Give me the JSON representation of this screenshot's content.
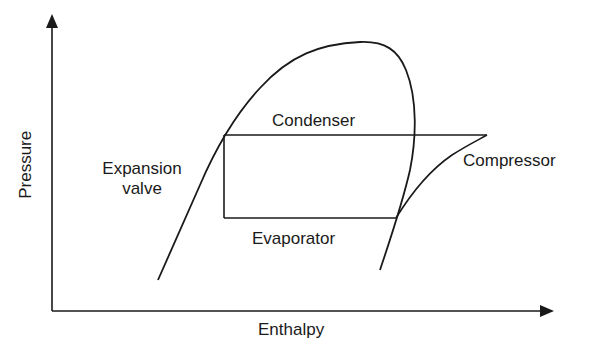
{
  "diagram": {
    "type": "pressure-enthalpy refrigeration cycle",
    "axes": {
      "x_label": "Enthalpy",
      "y_label": "Pressure"
    },
    "labels": {
      "condenser": "Condenser",
      "evaporator": "Evaporator",
      "compressor": "Compressor",
      "expansion_line1": "Expansion",
      "expansion_line2": "valve"
    },
    "colors": {
      "line": "#1a1a1a",
      "background": "#ffffff"
    }
  }
}
